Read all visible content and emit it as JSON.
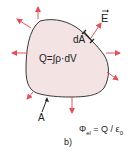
{
  "figure": {
    "panel_label": "b)",
    "surface_label": "A",
    "area_element_label": "dA",
    "field_label": "E",
    "charge_equation": "Q=∫ρ·dV",
    "flux_equation": {
      "symbol": "Φ",
      "subscript": "el",
      "rhs_start": " = Q / ε",
      "rhs_subscript": "0"
    }
  },
  "colors": {
    "surface_fill": "#f3e3e3",
    "surface_stroke": "#3a3a3a",
    "arrow": "#e0525a",
    "text": "#222222"
  }
}
